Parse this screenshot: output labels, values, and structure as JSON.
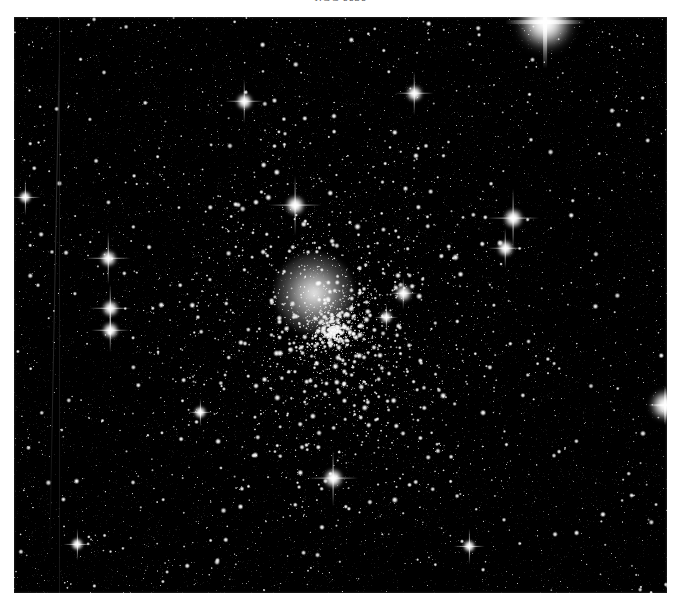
{
  "figure": {
    "caption": "NGC 6656",
    "caption_style": "italic-serif-clipped",
    "background_color": "#ffffff",
    "plate_color": "#000000",
    "plate": {
      "left": 14,
      "top": 17,
      "width": 653,
      "height": 576,
      "subject": "globular star cluster photographic plate",
      "sky_color": "#010101",
      "star_color": "#ffffff"
    }
  },
  "chart_data": {
    "type": "scatter",
    "title": "NGC 6656",
    "xlabel": "",
    "ylabel": "",
    "grid": false,
    "legend": "none",
    "xlim": [
      0,
      653
    ],
    "ylim": [
      0,
      576
    ],
    "cluster": {
      "center_x": 320,
      "center_y": 313,
      "core_radius": 42,
      "halo_radius": 175
    },
    "bright_stars": [
      {
        "x": 531,
        "y": 5,
        "r": 16,
        "spike": 46,
        "mag": "very bright saturated"
      },
      {
        "x": 94,
        "y": 241,
        "r": 5,
        "spike": 26,
        "mag": "bright"
      },
      {
        "x": 96,
        "y": 291,
        "r": 5,
        "spike": 24,
        "mag": "bright"
      },
      {
        "x": 96,
        "y": 313,
        "r": 5,
        "spike": 22,
        "mag": "bright"
      },
      {
        "x": 281,
        "y": 188,
        "r": 6,
        "spike": 30,
        "mag": "bright"
      },
      {
        "x": 499,
        "y": 201,
        "r": 6,
        "spike": 30,
        "mag": "bright"
      },
      {
        "x": 491,
        "y": 231,
        "r": 5,
        "spike": 20,
        "mag": "bright"
      },
      {
        "x": 319,
        "y": 461,
        "r": 6,
        "spike": 28,
        "mag": "bright"
      },
      {
        "x": 651,
        "y": 388,
        "r": 9,
        "spike": 20,
        "mag": "bright edge star"
      },
      {
        "x": 400,
        "y": 76,
        "r": 5,
        "spike": 22,
        "mag": "bright"
      },
      {
        "x": 230,
        "y": 84,
        "r": 5,
        "spike": 22,
        "mag": "bright"
      },
      {
        "x": 455,
        "y": 529,
        "r": 4,
        "spike": 18,
        "mag": "bright"
      },
      {
        "x": 11,
        "y": 180,
        "r": 4,
        "spike": 18,
        "mag": "bright"
      },
      {
        "x": 63,
        "y": 527,
        "r": 4,
        "spike": 16,
        "mag": "bright"
      },
      {
        "x": 372,
        "y": 300,
        "r": 4,
        "spike": 14,
        "mag": "bright"
      },
      {
        "x": 186,
        "y": 395,
        "r": 4,
        "spike": 14,
        "mag": "bright"
      },
      {
        "x": 389,
        "y": 276,
        "r": 5,
        "spike": 16,
        "mag": "bright"
      }
    ],
    "field_star_count": 2600,
    "cluster_star_count": 2400,
    "defects": [
      {
        "type": "scratch",
        "x": 40,
        "y_start": 30,
        "y_end": 540
      },
      {
        "type": "vertical-bar",
        "x": 45,
        "y_start": 0,
        "y_end": 576
      }
    ]
  }
}
